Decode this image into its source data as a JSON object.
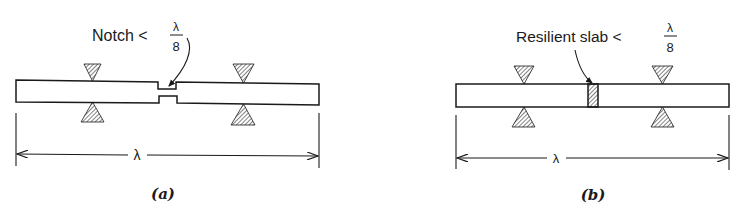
{
  "panels": [
    {
      "id": "a",
      "caption": "(a)",
      "label_main": "Notch <",
      "fraction_numerator": "λ",
      "fraction_denominator": "8",
      "dimension_label": "λ",
      "feature": "notch"
    },
    {
      "id": "b",
      "caption": "(b)",
      "label_main": "Resilient slab <",
      "fraction_numerator": "λ",
      "fraction_denominator": "8",
      "dimension_label": "λ",
      "feature": "resilient slab"
    }
  ],
  "colors": {
    "ink": "#1a1a1a",
    "background": "#ffffff"
  }
}
